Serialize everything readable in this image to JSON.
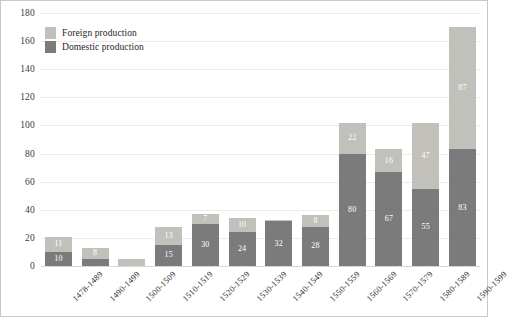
{
  "legend": {
    "position": "top-left",
    "items": [
      {
        "label": "Foreign production",
        "key": "foreign",
        "color": "#c2c0bb",
        "swatch_name": "legend-swatch-foreign"
      },
      {
        "label": "Domestic production",
        "key": "domestic",
        "color": "#7b7b7b",
        "swatch_name": "legend-swatch-domestic"
      }
    ]
  },
  "chart_data": {
    "type": "bar",
    "subtype": "stacked-vertical",
    "title": "",
    "subtitle": "",
    "xlabel": "",
    "ylabel": "",
    "ylim": [
      0,
      180
    ],
    "ytick_step": 20,
    "yticks": [
      "0",
      "20",
      "40",
      "60",
      "80",
      "100",
      "120",
      "140",
      "160",
      "180"
    ],
    "grid": true,
    "grid_axis": "y",
    "legend": [
      "Foreign production",
      "Domestic production"
    ],
    "legend_position": "top-left",
    "categories": [
      "1478-1489",
      "1490-1499",
      "1500-1509",
      "1510-1519",
      "1520-1529",
      "1530-1539",
      "1540-1549",
      "1550-1559",
      "1560-1569",
      "1570-1579",
      "1580-1589",
      "1590-1599"
    ],
    "series": [
      {
        "name": "Domestic production",
        "color": "#7b7b7b",
        "values": [
          10,
          5,
          0,
          15,
          30,
          24,
          32,
          28,
          80,
          67,
          55,
          83
        ],
        "labels": [
          "10",
          "5",
          "",
          "15",
          "30",
          "24",
          "32",
          "28",
          "80",
          "67",
          "55",
          "83"
        ]
      },
      {
        "name": "Foreign production",
        "color": "#c2c0bb",
        "values": [
          11,
          8,
          5,
          13,
          7,
          10,
          1,
          8,
          22,
          16,
          47,
          87
        ],
        "labels": [
          "11",
          "8",
          "5",
          "13",
          "7",
          "10",
          "",
          "8",
          "22",
          "16",
          "47",
          "87"
        ]
      }
    ],
    "totals": [
      21,
      13,
      5,
      28,
      37,
      34,
      33,
      36,
      102,
      83,
      102,
      170
    ]
  }
}
